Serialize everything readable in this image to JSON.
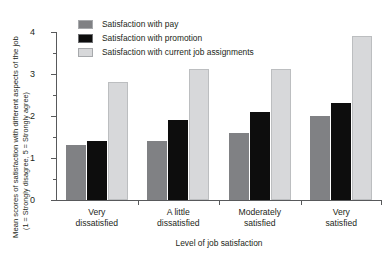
{
  "chart_data": {
    "type": "bar",
    "title": "",
    "subtitle": "",
    "xlabel": "Level of job satisfaction",
    "ylabel": "Mean scores of satisfaction with different aspects of the job",
    "ylabel_sub": "(1 = Strongly disagree, 5 = Strongly agree)",
    "categories": [
      "Very dissatisfied",
      "A little dissatisfied",
      "Moderately satisfied",
      "Very satisfied"
    ],
    "category_lines": [
      [
        "Very",
        "dissatisfied"
      ],
      [
        "A little",
        "dissatisfied"
      ],
      [
        "Moderately",
        "satisfied"
      ],
      [
        "Very",
        "satisfied"
      ]
    ],
    "series": [
      {
        "name": "Satisfaction with pay",
        "color": "#808184",
        "values": [
          1.3,
          1.4,
          1.6,
          2.0
        ]
      },
      {
        "name": "Satisfaction with promotion",
        "color": "#0d0d0d",
        "values": [
          1.4,
          1.9,
          2.1,
          2.3
        ]
      },
      {
        "name": "Satisfaction with current job assignments",
        "color": "#d7d8da",
        "values": [
          2.8,
          3.12,
          3.12,
          3.9
        ]
      }
    ],
    "ylim": [
      0,
      4
    ],
    "ytick_labels": [
      "0",
      "1",
      "2",
      "3",
      "4"
    ],
    "ytick_values": [
      0,
      1,
      2,
      3,
      4
    ],
    "yminor_values": [
      0.5,
      1.5,
      2.5,
      3.5
    ],
    "grid": false,
    "legend_position": "top-left-inside"
  }
}
